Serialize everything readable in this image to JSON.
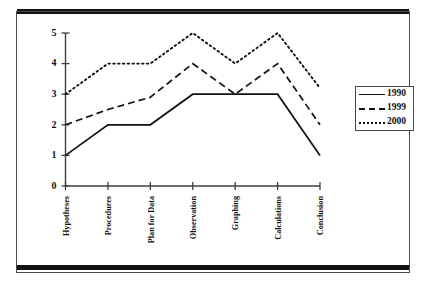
{
  "figure": {
    "background_color": "#ffffff",
    "frame_color": "#4a4a4a",
    "rule_color": "#111111",
    "line_color": "#111111"
  },
  "legend": {
    "position": "right",
    "entries": [
      {
        "label": "1990",
        "style": "solid",
        "icon": "solid-line-icon"
      },
      {
        "label": "1999",
        "style": "dashed",
        "icon": "dashed-line-icon"
      },
      {
        "label": "2000",
        "style": "dotted",
        "icon": "dotted-line-icon"
      }
    ]
  },
  "chart_data": {
    "type": "line",
    "title": "",
    "xlabel": "",
    "ylabel": "",
    "ylim": [
      0,
      5
    ],
    "yticks": [
      0,
      1,
      2,
      3,
      4,
      5
    ],
    "grid": false,
    "legend_position": "right",
    "categories": [
      "Hypotheses",
      "Procedures",
      "Plan for Data",
      "Observation",
      "Graphing",
      "Calculations",
      "Conclusion"
    ],
    "series": [
      {
        "name": "1990",
        "style": "solid",
        "values": [
          1,
          2,
          2,
          3,
          3,
          3,
          1
        ]
      },
      {
        "name": "1999",
        "style": "dashed",
        "values": [
          2,
          2.5,
          2.9,
          4,
          3,
          4,
          2
        ]
      },
      {
        "name": "2000",
        "style": "dotted",
        "values": [
          3,
          4,
          4,
          5,
          4,
          5,
          3.2
        ]
      }
    ]
  }
}
